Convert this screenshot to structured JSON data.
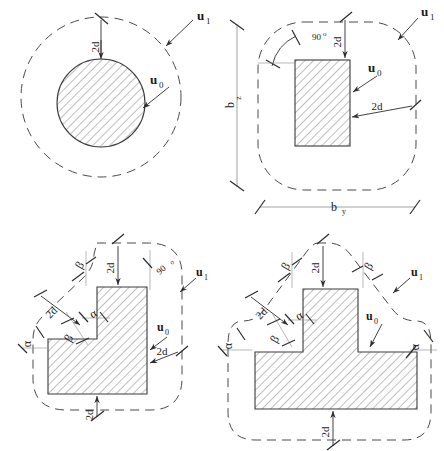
{
  "figure": {
    "stroke_color": "#3a3a3a",
    "hatch_color": "#6b6b6b",
    "dash_color": "#4a4a4a",
    "background": "#ffffff"
  },
  "panels": [
    {
      "id": "circular-column",
      "shape": "circle",
      "column_label": "u",
      "column_sub": "0",
      "perimeter_label": "u",
      "perimeter_sub": "1",
      "offsets": [
        {
          "text": "2d",
          "rotation": -90
        }
      ],
      "angles": [],
      "dimensions": []
    },
    {
      "id": "rectangular-column",
      "shape": "rectangle",
      "column_label": "u",
      "column_sub": "0",
      "perimeter_label": "u",
      "perimeter_sub": "1",
      "offsets": [
        {
          "text": "2d",
          "rotation": -90
        },
        {
          "text": "2d",
          "rotation": 0
        }
      ],
      "angles": [
        {
          "text": "90",
          "unit": "o"
        }
      ],
      "dimensions": [
        {
          "text": "b",
          "sub": "z",
          "rotation": -90
        },
        {
          "text": "b",
          "sub": "y",
          "rotation": 0
        }
      ]
    },
    {
      "id": "l-shaped-column",
      "shape": "L",
      "column_label": "u",
      "column_sub": "0",
      "perimeter_label": "u",
      "perimeter_sub": "1",
      "offsets": [
        {
          "text": "2d",
          "rotation": -90
        },
        {
          "text": "2d",
          "rotation": -45
        },
        {
          "text": "2d",
          "rotation": 0
        },
        {
          "text": "2d",
          "rotation": -90
        }
      ],
      "angles": [
        {
          "text": "90",
          "unit": "o"
        }
      ],
      "greek": [
        {
          "text": "β",
          "rotation": -60
        },
        {
          "text": "α",
          "rotation": -30
        },
        {
          "text": "β",
          "rotation": -60
        },
        {
          "text": "α",
          "rotation": -90
        }
      ],
      "dimensions": []
    },
    {
      "id": "t-shaped-column",
      "shape": "T",
      "column_label": "u",
      "column_sub": "0",
      "perimeter_label": "u",
      "perimeter_sub": "1",
      "offsets": [
        {
          "text": "2d",
          "rotation": -90
        },
        {
          "text": "2d",
          "rotation": -45
        },
        {
          "text": "2d",
          "rotation": -90
        }
      ],
      "angles": [],
      "greek": [
        {
          "text": "β",
          "rotation": -60
        },
        {
          "text": "β",
          "rotation": -60
        },
        {
          "text": "α",
          "rotation": -30
        },
        {
          "text": "β",
          "rotation": -60
        },
        {
          "text": "α",
          "rotation": -90
        },
        {
          "text": "α",
          "rotation": -90
        }
      ],
      "dimensions": []
    }
  ],
  "text_tokens": {
    "two_d": "2d",
    "u": "u",
    "zero": "0",
    "one": "1",
    "ninety": "90",
    "degree": "o",
    "b": "b",
    "z": "z",
    "y": "y",
    "alpha": "α",
    "beta": "β"
  }
}
